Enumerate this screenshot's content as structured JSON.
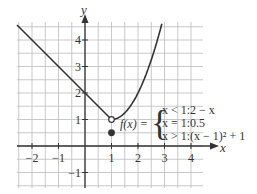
{
  "chart_data": {
    "type": "line",
    "title": "",
    "xlabel": "x",
    "ylabel": "y",
    "xlim": [
      -2.5,
      4.5
    ],
    "ylim": [
      -1.5,
      4.75
    ],
    "grid": true,
    "grid_step": 0.5,
    "x_ticks": [
      "-2",
      "-1",
      "1",
      "2",
      "3",
      "4"
    ],
    "y_ticks": [
      "-1",
      "1",
      "2",
      "3",
      "4"
    ],
    "function_label": "f(x) =",
    "pieces": [
      {
        "condition": "x < 1",
        "expression": "2 − x"
      },
      {
        "condition": "x = 1",
        "expression": "0.5"
      },
      {
        "condition": "x > 1",
        "expression": "(x − 1)² + 1"
      }
    ],
    "piece_text": [
      "x < 1:2 − x",
      "x = 1:0.5",
      "x > 1:(x − 1)² + 1"
    ],
    "points": [
      {
        "x": 1,
        "y": 1,
        "style": "open"
      },
      {
        "x": 1,
        "y": 0.5,
        "style": "closed"
      }
    ],
    "series": [
      {
        "name": "2 - x",
        "x": [
          -2.5,
          1
        ],
        "y": [
          4.5,
          1
        ]
      },
      {
        "name": "(x-1)^2+1",
        "x": [
          1,
          1.5,
          2,
          2.5,
          2.94
        ],
        "y": [
          1,
          1.25,
          2,
          3.25,
          4.75
        ]
      }
    ]
  }
}
